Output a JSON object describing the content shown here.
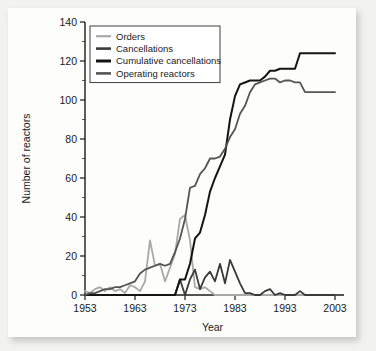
{
  "chart_data": {
    "type": "line",
    "title": "",
    "xlabel": "Year",
    "ylabel": "Number of reactors",
    "xlim": [
      1953,
      2004
    ],
    "ylim": [
      0,
      140
    ],
    "xticks": [
      1953,
      1963,
      1973,
      1983,
      1993,
      2003
    ],
    "yticks": [
      0,
      20,
      40,
      60,
      80,
      100,
      120,
      140
    ],
    "xtick_labels": [
      "1953",
      "1963",
      "1973",
      "1983",
      "1993",
      "2003"
    ],
    "ytick_labels": [
      "0",
      "20",
      "40",
      "60",
      "80",
      "100",
      "120",
      "140"
    ],
    "minor_tick_step": 10,
    "grid": false,
    "legend_position": "top-left",
    "x": [
      1953,
      1954,
      1955,
      1956,
      1957,
      1958,
      1959,
      1960,
      1961,
      1962,
      1963,
      1964,
      1965,
      1966,
      1967,
      1968,
      1969,
      1970,
      1971,
      1972,
      1973,
      1974,
      1975,
      1976,
      1977,
      1978,
      1979,
      1980,
      1981,
      1982,
      1983,
      1984,
      1985,
      1986,
      1987,
      1988,
      1989,
      1990,
      1991,
      1992,
      1993,
      1994,
      1995,
      1996,
      1997,
      1998,
      1999,
      2000,
      2001,
      2002,
      2003
    ],
    "series": [
      {
        "name": "Orders",
        "color": "#a9a9a9",
        "width": 1.8,
        "values": [
          2,
          1,
          3,
          4,
          2,
          4,
          2,
          3,
          1,
          5,
          4,
          2,
          7,
          28,
          15,
          16,
          7,
          14,
          21,
          39,
          41,
          28,
          4,
          3,
          4,
          2,
          0,
          0,
          0,
          0,
          0,
          0,
          0,
          0,
          0,
          0,
          0,
          0,
          0,
          0,
          0,
          0,
          0,
          0,
          0,
          0,
          0,
          0,
          0,
          0,
          0
        ]
      },
      {
        "name": "Cancellations",
        "color": "#3a3a3a",
        "width": 1.8,
        "values": [
          0,
          0,
          0,
          0,
          0,
          0,
          0,
          0,
          0,
          0,
          0,
          0,
          0,
          0,
          0,
          0,
          0,
          0,
          0,
          8,
          0,
          8,
          13,
          3,
          9,
          12,
          7,
          16,
          6,
          18,
          12,
          6,
          1,
          1,
          0,
          0,
          2,
          3,
          0,
          1,
          0,
          0,
          0,
          2,
          0,
          0,
          0,
          0,
          0,
          0,
          0
        ]
      },
      {
        "name": "Cumulative cancellations",
        "color": "#141414",
        "width": 2.0,
        "values": [
          0,
          0,
          0,
          0,
          0,
          0,
          0,
          0,
          0,
          0,
          0,
          0,
          0,
          0,
          0,
          0,
          0,
          0,
          0,
          8,
          8,
          16,
          29,
          32,
          41,
          53,
          60,
          66,
          72,
          90,
          102,
          108,
          109,
          110,
          110,
          110,
          112,
          115,
          115,
          116,
          116,
          116,
          116,
          124,
          124,
          124,
          124,
          124,
          124,
          124,
          124
        ]
      },
      {
        "name": "Operating reactors",
        "color": "#555555",
        "width": 1.8,
        "values": [
          0,
          1,
          1,
          2,
          3,
          3,
          4,
          4,
          5,
          6,
          7,
          11,
          13,
          14,
          15,
          16,
          15,
          16,
          22,
          29,
          39,
          55,
          56,
          62,
          65,
          70,
          70,
          71,
          75,
          81,
          85,
          93,
          97,
          104,
          108,
          109,
          110,
          111,
          111,
          109,
          110,
          110,
          109,
          109,
          104,
          104,
          104,
          104,
          104,
          104,
          104
        ]
      }
    ],
    "legend": [
      {
        "label": "Orders",
        "color": "#a9a9a9",
        "width": 2.2
      },
      {
        "label": "Cancellations",
        "color": "#3a3a3a",
        "width": 2.6
      },
      {
        "label": "Cumulative cancellations",
        "color": "#141414",
        "width": 3.0
      },
      {
        "label": "Operating reactors",
        "color": "#555555",
        "width": 2.6
      }
    ]
  }
}
